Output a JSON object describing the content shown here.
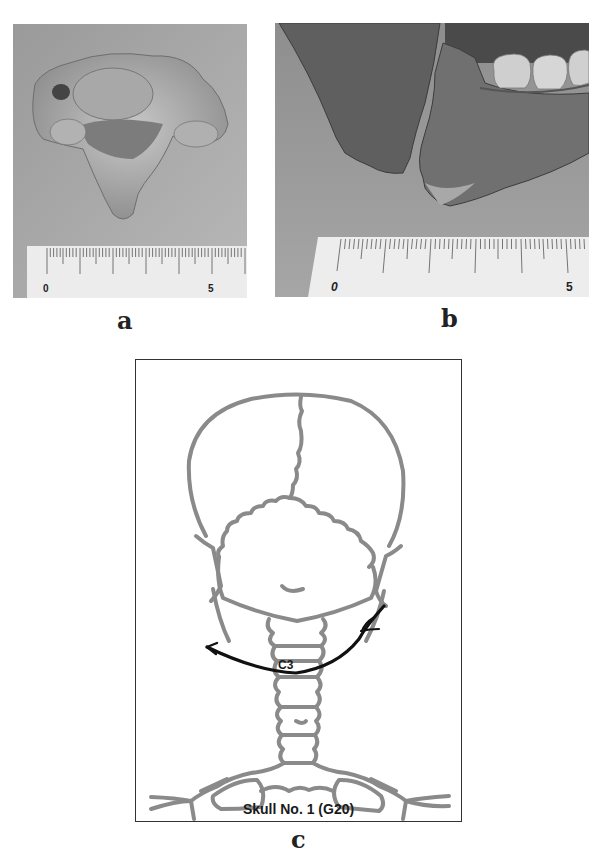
{
  "panels": {
    "a": {
      "label": "a",
      "description": "photograph of cervical vertebra with ruler",
      "ruler": {
        "start_label": "0",
        "end_label": "5",
        "unit": "cm"
      }
    },
    "b": {
      "label": "b",
      "description": "photograph of mandible angle fracture with ruler",
      "ruler": {
        "start_label": "0",
        "end_label": "5",
        "unit": "cm"
      }
    },
    "c": {
      "label": "c",
      "caption": "Skull No. 1 (G20)",
      "vertebra_label": "C3",
      "colors": {
        "outline": "#8a8a8a",
        "arrow": "#111111",
        "border": "#333333"
      }
    }
  }
}
